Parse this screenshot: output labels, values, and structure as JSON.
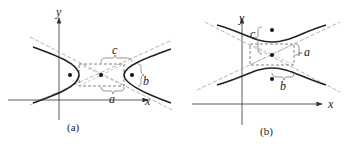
{
  "panels": [
    {
      "id": "a",
      "caption": "(a)",
      "orientation": "horizontal",
      "labels": {
        "x_axis": "x",
        "y_axis": "y",
        "a": "a",
        "b": "b",
        "c": "c"
      }
    },
    {
      "id": "b",
      "caption": "(b)",
      "orientation": "vertical",
      "labels": {
        "x_axis": "x",
        "y_axis": "y",
        "a": "a",
        "b": "b",
        "c": "c"
      }
    }
  ],
  "colors": {
    "curve": "#222222",
    "asymptote": "#aaaaaa",
    "box": "#777777",
    "axis": "#333333"
  }
}
